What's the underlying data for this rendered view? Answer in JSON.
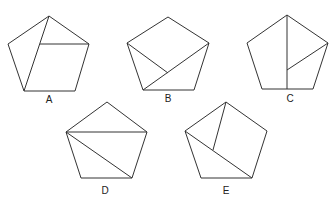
{
  "figure": {
    "stroke_color": "#333333",
    "background": "#ffffff",
    "pentagons": [
      {
        "label": "A",
        "outline": [
          [
            49,
            16
          ],
          [
            89,
            44
          ],
          [
            75,
            91
          ],
          [
            24,
            91
          ],
          [
            8,
            44
          ]
        ],
        "inner_lines": [
          [
            [
              49,
              16
            ],
            [
              24,
              91
            ]
          ],
          [
            [
              40,
              44
            ],
            [
              89,
              44
            ]
          ]
        ],
        "label_pos": [
          49,
          103
        ]
      },
      {
        "label": "B",
        "outline": [
          [
            168,
            17
          ],
          [
            209,
            43
          ],
          [
            194,
            90
          ],
          [
            143,
            90
          ],
          [
            127,
            43
          ]
        ],
        "inner_lines": [
          [
            [
              127,
              43
            ],
            [
              168,
              73
            ]
          ],
          [
            [
              209,
              43
            ],
            [
              143,
              90
            ]
          ]
        ],
        "label_pos": [
          168,
          102
        ]
      },
      {
        "label": "C",
        "outline": [
          [
            287,
            15
          ],
          [
            328,
            43
          ],
          [
            313,
            89
          ],
          [
            262,
            89
          ],
          [
            247,
            43
          ]
        ],
        "inner_lines": [
          [
            [
              287,
              15
            ],
            [
              287,
              89
            ]
          ],
          [
            [
              328,
              43
            ],
            [
              287,
              70
            ]
          ]
        ],
        "label_pos": [
          290,
          102
        ]
      },
      {
        "label": "D",
        "outline": [
          [
            107,
            102
          ],
          [
            147,
            132
          ],
          [
            132,
            178
          ],
          [
            81,
            178
          ],
          [
            66,
            132
          ]
        ],
        "inner_lines": [
          [
            [
              66,
              132
            ],
            [
              147,
              132
            ]
          ],
          [
            [
              66,
              132
            ],
            [
              132,
              178
            ]
          ]
        ],
        "label_pos": [
          105,
          194
        ]
      },
      {
        "label": "E",
        "outline": [
          [
            226,
            102
          ],
          [
            267,
            131
          ],
          [
            252,
            178
          ],
          [
            201,
            178
          ],
          [
            185,
            131
          ]
        ],
        "inner_lines": [
          [
            [
              185,
              131
            ],
            [
              252,
              178
            ]
          ],
          [
            [
              226,
              102
            ],
            [
              213,
              150
            ]
          ]
        ],
        "label_pos": [
          226,
          194
        ]
      }
    ]
  }
}
